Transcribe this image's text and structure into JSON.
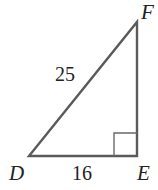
{
  "figure": {
    "type": "right-triangle",
    "stroke_color": "#5a5a5a",
    "text_color": "#222222",
    "vertices": {
      "D": {
        "label": "D",
        "x": 29,
        "y": 156
      },
      "E": {
        "label": "E",
        "x": 137,
        "y": 156
      },
      "F": {
        "label": "F",
        "x": 137,
        "y": 22
      }
    },
    "right_angle_at": "E",
    "sides": {
      "hypotenuse_DF": {
        "label": "25"
      },
      "leg_DE": {
        "label": "16"
      }
    }
  }
}
